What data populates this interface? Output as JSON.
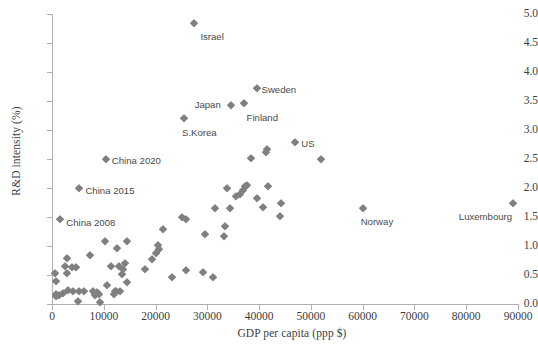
{
  "chart_data": {
    "type": "scatter",
    "title": "",
    "xlabel": "GDP per capita (ppp $)",
    "ylabel": "R&D intensity (%)",
    "xlim": [
      0,
      90000
    ],
    "ylim": [
      0.0,
      5.0
    ],
    "xticks": [
      0,
      10000,
      20000,
      30000,
      40000,
      50000,
      60000,
      70000,
      80000,
      90000
    ],
    "xtick_labels": [
      "0",
      "10000",
      "20000",
      "30000",
      "40000",
      "50000",
      "60000",
      "70000",
      "80000",
      "90000"
    ],
    "yticks": [
      0.0,
      0.5,
      1.0,
      1.5,
      2.0,
      2.5,
      3.0,
      3.5,
      4.0,
      4.5,
      5.0
    ],
    "ytick_labels": [
      "0.0",
      "0.5",
      "1.0",
      "1.5",
      "2.0",
      "2.5",
      "3.0",
      "3.5",
      "4.0",
      "4.5",
      "5.0"
    ],
    "grid": false,
    "legend": null,
    "marker": {
      "shape": "diamond",
      "color": "#808080",
      "size": 5.6
    },
    "points": [
      {
        "x": 27500,
        "y": 4.85,
        "label": "Israel",
        "label_dx": 6,
        "label_dy": 13
      },
      {
        "x": 39500,
        "y": 3.73,
        "label": "Sweden",
        "label_dx": 5,
        "label_dy": 1
      },
      {
        "x": 37000,
        "y": 3.47,
        "label": "Finland",
        "label_dx": 3,
        "label_dy": 14
      },
      {
        "x": 34500,
        "y": 3.43,
        "label": "Japan",
        "label_dx": -36,
        "label_dy": -1
      },
      {
        "x": 25500,
        "y": 3.2,
        "label": "S.Korea",
        "label_dx": -2,
        "label_dy": 14
      },
      {
        "x": 47000,
        "y": 2.8,
        "label": "US",
        "label_dx": 6,
        "label_dy": 1
      },
      {
        "x": 60000,
        "y": 1.65,
        "label": "Norway",
        "label_dx": -2,
        "label_dy": 13
      },
      {
        "x": 89000,
        "y": 1.75,
        "label": "Luxembourg",
        "label_dx": -54,
        "label_dy": 13
      },
      {
        "x": 10400,
        "y": 2.5,
        "label": "China 2020",
        "label_dx": 6,
        "label_dy": 1
      },
      {
        "x": 5300,
        "y": 2.0,
        "label": "China 2015",
        "label_dx": 6,
        "label_dy": 2
      },
      {
        "x": 1600,
        "y": 1.47,
        "label": "China 2008",
        "label_dx": 6,
        "label_dy": 3
      },
      {
        "x": 41500,
        "y": 2.67,
        "label": null
      },
      {
        "x": 41300,
        "y": 2.62,
        "label": null
      },
      {
        "x": 38500,
        "y": 2.52,
        "label": null
      },
      {
        "x": 52000,
        "y": 2.5,
        "label": null
      },
      {
        "x": 41800,
        "y": 2.04,
        "label": null
      },
      {
        "x": 37700,
        "y": 2.05,
        "label": null
      },
      {
        "x": 33800,
        "y": 2.0,
        "label": null
      },
      {
        "x": 36900,
        "y": 1.97,
        "label": null
      },
      {
        "x": 39500,
        "y": 1.83,
        "label": null
      },
      {
        "x": 44300,
        "y": 1.74,
        "label": null
      },
      {
        "x": 44100,
        "y": 1.52,
        "label": null
      },
      {
        "x": 34300,
        "y": 1.66,
        "label": null
      },
      {
        "x": 31400,
        "y": 1.65,
        "label": null
      },
      {
        "x": 40800,
        "y": 1.68,
        "label": null
      },
      {
        "x": 33500,
        "y": 1.34,
        "label": null
      },
      {
        "x": 33200,
        "y": 1.17,
        "label": null
      },
      {
        "x": 29500,
        "y": 1.2,
        "label": null
      },
      {
        "x": 25200,
        "y": 1.5,
        "label": null
      },
      {
        "x": 25800,
        "y": 1.46,
        "label": null
      },
      {
        "x": 21500,
        "y": 1.29,
        "label": null
      },
      {
        "x": 20400,
        "y": 1.02,
        "label": null
      },
      {
        "x": 20600,
        "y": 0.95,
        "label": null
      },
      {
        "x": 20000,
        "y": 0.88,
        "label": null
      },
      {
        "x": 19400,
        "y": 0.78,
        "label": null
      },
      {
        "x": 17900,
        "y": 0.6,
        "label": null
      },
      {
        "x": 23200,
        "y": 0.47,
        "label": null
      },
      {
        "x": 25800,
        "y": 0.58,
        "label": null
      },
      {
        "x": 29200,
        "y": 0.56,
        "label": null
      },
      {
        "x": 31100,
        "y": 0.46,
        "label": null
      },
      {
        "x": 14400,
        "y": 1.08,
        "label": null
      },
      {
        "x": 10300,
        "y": 1.08,
        "label": null
      },
      {
        "x": 12600,
        "y": 0.96,
        "label": null
      },
      {
        "x": 7300,
        "y": 0.85,
        "label": null
      },
      {
        "x": 11400,
        "y": 0.66,
        "label": null
      },
      {
        "x": 13000,
        "y": 0.65,
        "label": null
      },
      {
        "x": 14100,
        "y": 0.71,
        "label": null
      },
      {
        "x": 13700,
        "y": 0.6,
        "label": null
      },
      {
        "x": 13600,
        "y": 0.52,
        "label": null
      },
      {
        "x": 14500,
        "y": 0.38,
        "label": null
      },
      {
        "x": 10700,
        "y": 0.33,
        "label": null
      },
      {
        "x": 12400,
        "y": 0.22,
        "label": null
      },
      {
        "x": 13200,
        "y": 0.23,
        "label": null
      },
      {
        "x": 2900,
        "y": 0.8,
        "label": null
      },
      {
        "x": 4600,
        "y": 0.63,
        "label": null
      },
      {
        "x": 2500,
        "y": 0.66,
        "label": null
      },
      {
        "x": 3900,
        "y": 0.63,
        "label": null
      },
      {
        "x": 2900,
        "y": 0.54,
        "label": null
      },
      {
        "x": 600,
        "y": 0.53,
        "label": null
      },
      {
        "x": 800,
        "y": 0.4,
        "label": null
      },
      {
        "x": 3100,
        "y": 0.24,
        "label": null
      },
      {
        "x": 4100,
        "y": 0.22,
        "label": null
      },
      {
        "x": 5300,
        "y": 0.22,
        "label": null
      },
      {
        "x": 6100,
        "y": 0.23,
        "label": null
      },
      {
        "x": 8000,
        "y": 0.22,
        "label": null
      },
      {
        "x": 8300,
        "y": 0.16,
        "label": null
      },
      {
        "x": 8700,
        "y": 0.21,
        "label": null
      },
      {
        "x": 9100,
        "y": 0.18,
        "label": null
      },
      {
        "x": 700,
        "y": 0.17,
        "label": null
      },
      {
        "x": 750,
        "y": 0.13,
        "label": null
      },
      {
        "x": 1400,
        "y": 0.15,
        "label": null
      },
      {
        "x": 2200,
        "y": 0.19,
        "label": null
      },
      {
        "x": 5000,
        "y": 0.06,
        "label": null
      },
      {
        "x": 9300,
        "y": 0.03,
        "label": null
      },
      {
        "x": 11900,
        "y": 0.18,
        "label": null
      },
      {
        "x": 12100,
        "y": 0.23,
        "label": null
      },
      {
        "x": 36400,
        "y": 1.9,
        "label": null
      },
      {
        "x": 37200,
        "y": 2.04,
        "label": null
      },
      {
        "x": 35500,
        "y": 1.87,
        "label": null
      }
    ]
  }
}
